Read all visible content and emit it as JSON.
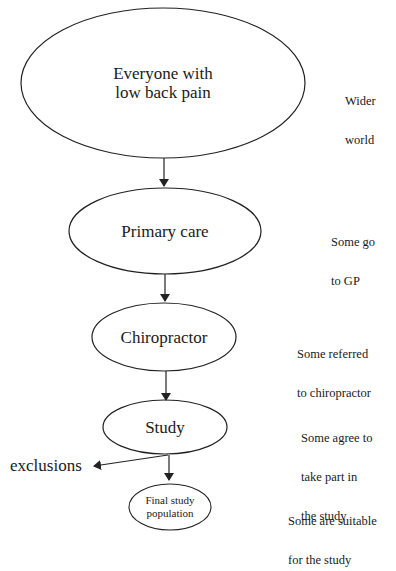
{
  "diagram": {
    "nodes": [
      {
        "id": "everyone",
        "lines": [
          "Everyone with",
          "low back pain"
        ],
        "annotation": [
          "Wider",
          "world"
        ]
      },
      {
        "id": "primary_care",
        "lines": [
          "Primary care"
        ],
        "annotation": [
          "Some go",
          "to GP"
        ]
      },
      {
        "id": "chiropractor",
        "lines": [
          "Chiropractor"
        ],
        "annotation": [
          "Some referred",
          "to chiropractor"
        ]
      },
      {
        "id": "study",
        "lines": [
          "Study"
        ],
        "annotation": [
          "Some agree to",
          "take part in",
          "the study"
        ]
      },
      {
        "id": "final",
        "lines": [
          "Final study",
          "population"
        ],
        "annotation": [
          "Some are suitable",
          "for the study"
        ]
      }
    ],
    "branch": {
      "label": "exclusions",
      "from": "study"
    },
    "colors": {
      "stroke": "#222222",
      "text": "#1a1a1a",
      "background": "#ffffff"
    }
  }
}
